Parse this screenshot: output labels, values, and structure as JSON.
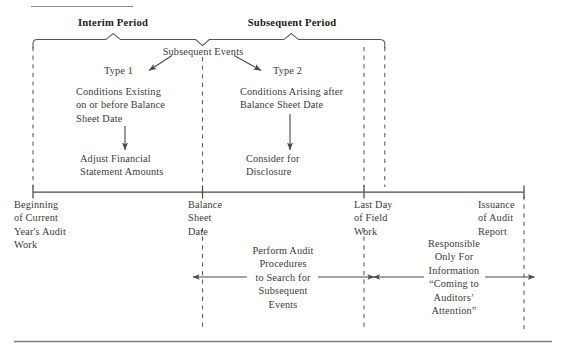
{
  "figure": {
    "colors": {
      "rule": "#7d7d7d",
      "line": "#4a4a4a",
      "dashed": "#5a5a5a",
      "text": "#3b3b3b",
      "heading": "#1b1b1b",
      "background": "#ffffff"
    }
  },
  "headings": {
    "interim_period": "Interim Period",
    "subsequent_period": "Subsequent Period"
  },
  "center": {
    "subsequent_events": "Subsequent Events",
    "type1_label": "Type 1",
    "type2_label": "Type 2",
    "type1_description": "Conditions Existing\non or before Balance\nSheet Date",
    "type2_description": "Conditions Arising after\nBalance Sheet Date",
    "type1_action": "Adjust Financial\nStatement Amounts",
    "type2_action": "Consider for\nDisclosure"
  },
  "timeline": {
    "milestones": [
      {
        "label": "Beginning\nof Current\nYear's Audit\nWork"
      },
      {
        "label": "Balance\nSheet\nDate"
      },
      {
        "label": "Last Day\nof Field\nWork"
      },
      {
        "label": "Issuance\nof Audit\nReport"
      }
    ]
  },
  "spans": [
    {
      "label": "Perform Audit\nProcedures\nto Search for\nSubsequent\nEvents"
    },
    {
      "label": "Responsible\nOnly For\nInformation\n“Coming to\nAuditors’\nAttention”"
    }
  ]
}
